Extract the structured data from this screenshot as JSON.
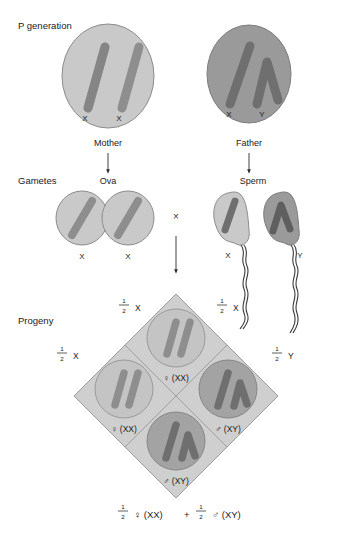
{
  "figure": {
    "background": "#ffffff"
  },
  "colors": {
    "cell_light": "#c9c9c9",
    "cell_dark": "#9a9a9a",
    "chromosome_light": "#8e8e8e",
    "chromosome_dark": "#6f6f6f",
    "punnett_fill": "#cfcfcf",
    "outline": "#6b6b6b",
    "text": "#1a1a1a",
    "arrow": "#2b2b2b"
  },
  "sections": {
    "p_generation_label": "P generation",
    "gametes_label": "Gametes",
    "progeny_label": "Progeny"
  },
  "p_generation": {
    "mother": {
      "role_label": "Mother",
      "chromosomes": [
        {
          "label": "X",
          "shape": "bar"
        },
        {
          "label": "X",
          "shape": "bar"
        }
      ],
      "cell_shade": "light"
    },
    "father": {
      "role_label": "Father",
      "chromosomes": [
        {
          "label": "X",
          "shape": "bar"
        },
        {
          "label": "Y",
          "shape": "vee"
        }
      ],
      "cell_shade": "dark"
    }
  },
  "gametes": {
    "ova_label": "Ova",
    "ova": [
      {
        "label": "X",
        "shape": "bar",
        "cell_shade": "light"
      },
      {
        "label": "X",
        "shape": "bar",
        "cell_shade": "light"
      }
    ],
    "sperm_label": "Sperm",
    "sperm": [
      {
        "label": "X",
        "shape": "bar",
        "cell_shade": "light"
      },
      {
        "label": "Y",
        "shape": "vee",
        "cell_shade": "dark"
      }
    ],
    "cross_symbol": "×"
  },
  "punnett": {
    "top_labels": [
      {
        "numerator": "1",
        "denominator": "2",
        "allele": "X"
      },
      {
        "numerator": "1",
        "denominator": "2",
        "allele": "X"
      }
    ],
    "side_labels": [
      {
        "numerator": "1",
        "denominator": "2",
        "allele": "X",
        "position": "left"
      },
      {
        "numerator": "1",
        "denominator": "2",
        "allele": "Y",
        "position": "right"
      }
    ],
    "cells": [
      {
        "position": "top",
        "genotype": "♀ (XX)",
        "sex_symbol": "♀",
        "genotype_text": "(XX)",
        "cell_shade": "light",
        "chromosomes": [
          "bar",
          "bar"
        ]
      },
      {
        "position": "left",
        "genotype": "♀ (XX)",
        "sex_symbol": "♀",
        "genotype_text": "(XX)",
        "cell_shade": "light",
        "chromosomes": [
          "bar",
          "bar"
        ]
      },
      {
        "position": "right",
        "genotype": "♂ (XY)",
        "sex_symbol": "♂",
        "genotype_text": "(XY)",
        "cell_shade": "dark",
        "chromosomes": [
          "bar",
          "vee"
        ]
      },
      {
        "position": "bottom",
        "genotype": "♂ (XY)",
        "sex_symbol": "♂",
        "genotype_text": "(XY)",
        "cell_shade": "dark",
        "chromosomes": [
          "bar",
          "vee"
        ]
      }
    ]
  },
  "summary": {
    "first_numerator": "1",
    "first_denominator": "2",
    "first_term": "♀ (XX)",
    "operator": "+",
    "second_numerator": "1",
    "second_denominator": "2",
    "second_term": "♂ (XY)"
  }
}
